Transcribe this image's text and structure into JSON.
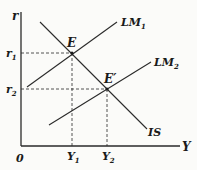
{
  "diagram": {
    "axes": {
      "y_label": "r",
      "x_label": "Y",
      "origin_label": "0"
    },
    "curves": [
      {
        "id": "LM1",
        "label": "LM",
        "subscript": "1"
      },
      {
        "id": "LM2",
        "label": "LM",
        "subscript": "2"
      },
      {
        "id": "IS",
        "label": "IS",
        "subscript": ""
      }
    ],
    "points": [
      {
        "id": "E",
        "label": "E"
      },
      {
        "id": "E2",
        "label": "E′"
      }
    ],
    "y_ticks": [
      {
        "label": "r",
        "subscript": "1"
      },
      {
        "label": "r",
        "subscript": "2"
      }
    ],
    "x_ticks": [
      {
        "label": "Y",
        "subscript": "1"
      },
      {
        "label": "Y",
        "subscript": "2"
      }
    ],
    "colors": {
      "line": "#2a2a2a",
      "background": "#fbfbf9"
    }
  }
}
